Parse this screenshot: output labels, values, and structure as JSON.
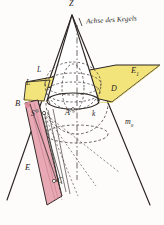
{
  "figure": {
    "title_text": "Achse des Kegels",
    "colors": {
      "plane_e1_fill": "#f2e37a",
      "plane_e_fill": "#e9a9b4",
      "line": "#2a2422",
      "dashed": "#4a4340",
      "background": "#fdfcfa"
    },
    "labels": {
      "apex": "Z",
      "axis": "Achse des Kegels",
      "plane_upper": "E",
      "plane_upper_sub": "1",
      "plane_lower": "E",
      "point_l_upper": "L",
      "point_l_lower": "L",
      "point_b": "B",
      "point_s": "S",
      "point_c": "C",
      "point_a": "A",
      "point_d": "D",
      "curve_k": "k",
      "line_m": "m",
      "line_m_sub": "0"
    }
  }
}
